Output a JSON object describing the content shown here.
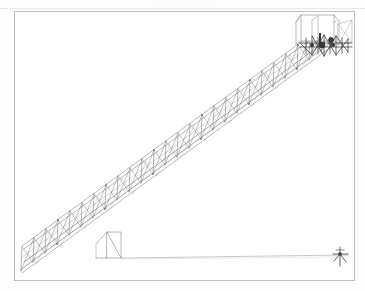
{
  "document": {
    "page_header_text": "· · · · · · · · · · · · · · · · · ·",
    "header_note": "faint illegible scanned running head"
  },
  "drawing": {
    "title": "Lattice boom crane — side elevation",
    "frame": {
      "x": 14,
      "y": 11,
      "width": 341,
      "height": 270,
      "stroke": "#bdbdbd"
    },
    "background": "#ffffff",
    "ink_color": "#6e6e6e",
    "ink_dark": "#3a3a3a",
    "ink_light": "#9a9a9a",
    "boom": {
      "label": "lattice boom truss",
      "base_x": 20,
      "base_y": 268,
      "tip_x": 332,
      "tip_y": 40,
      "depth": 26,
      "bay_count": 26
    },
    "machine_house": {
      "label": "operator cab / machinery housing",
      "x": 300,
      "y": 14,
      "width": 34,
      "height": 27
    },
    "hoist_cluster": {
      "label": "hoist and sheave assembly",
      "x": 296,
      "y": 34,
      "width": 58,
      "height": 22
    },
    "ground_line": {
      "label": "ground / load line",
      "x1": 118,
      "y1": 258,
      "x2": 348,
      "y2": 255
    },
    "anchor": {
      "label": "load hook anchor point",
      "x": 340,
      "y": 258
    },
    "base_support": {
      "label": "boom base pedestal",
      "x": 107,
      "y": 232,
      "width": 14,
      "height": 27
    }
  }
}
